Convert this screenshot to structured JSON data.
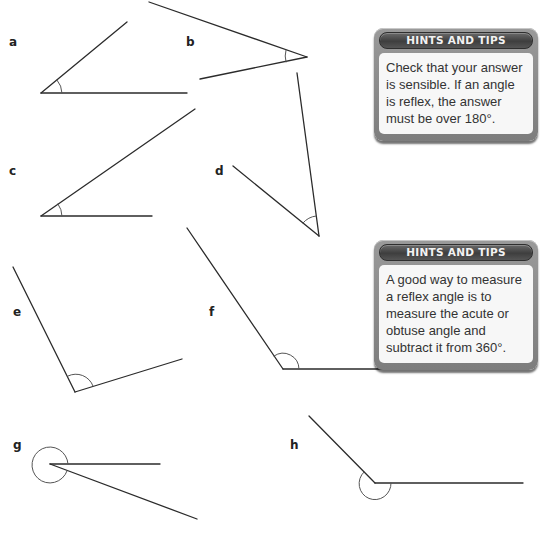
{
  "angles": [
    {
      "label": "a",
      "label_pos": [
        9,
        35
      ]
    },
    {
      "label": "b",
      "label_pos": [
        186,
        35
      ]
    },
    {
      "label": "c",
      "label_pos": [
        9,
        164
      ]
    },
    {
      "label": "d",
      "label_pos": [
        215,
        164
      ]
    },
    {
      "label": "e",
      "label_pos": [
        13,
        305
      ]
    },
    {
      "label": "f",
      "label_pos": [
        209,
        305
      ]
    },
    {
      "label": "g",
      "label_pos": [
        13,
        438
      ]
    },
    {
      "label": "h",
      "label_pos": [
        290,
        438
      ]
    }
  ],
  "hints": [
    {
      "title": "HINTS AND TIPS",
      "body": "Check that your answer is sensible. If an angle is reflex, the answer must be over 180°."
    },
    {
      "title": "HINTS AND TIPS",
      "body": "A good way to measure a reflex angle is to measure the acute or obtuse angle and subtract it from 360°."
    }
  ],
  "colors": {
    "line": "#2b2b2b",
    "arc": "#555555",
    "hint_frame": "#8c8c8c",
    "hint_title_bg": "#4a4a4a"
  }
}
